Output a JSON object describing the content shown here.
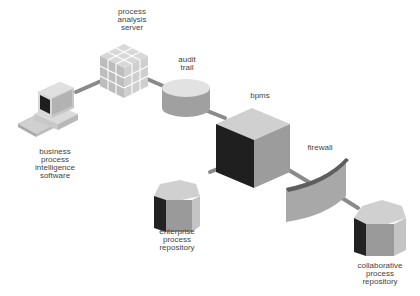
{
  "diagram": {
    "type": "architecture",
    "nodes": [
      {
        "id": "bpi",
        "label_lines": [
          "business",
          "process",
          "intelligence",
          "software"
        ],
        "shape": "computer-workstation"
      },
      {
        "id": "pas",
        "label_lines": [
          "process",
          "analysis",
          "server"
        ],
        "shape": "cube-grid"
      },
      {
        "id": "audit",
        "label_lines": [
          "audit",
          "trail"
        ],
        "shape": "cylinder"
      },
      {
        "id": "bpms",
        "label_lines": [
          "bpms"
        ],
        "shape": "cube"
      },
      {
        "id": "firewall",
        "label_lines": [
          "firewall"
        ],
        "shape": "curved-wall"
      },
      {
        "id": "epr",
        "label_lines": [
          "enterprise",
          "process",
          "repository"
        ],
        "shape": "hexagonal-prism"
      },
      {
        "id": "cpr",
        "label_lines": [
          "collaborative",
          "process",
          "repository"
        ],
        "shape": "hexagonal-prism"
      }
    ],
    "edges": [
      {
        "from": "bpi",
        "to": "pas"
      },
      {
        "from": "pas",
        "to": "audit"
      },
      {
        "from": "audit",
        "to": "bpms"
      },
      {
        "from": "bpms",
        "to": "epr"
      },
      {
        "from": "bpms",
        "to": "firewall"
      },
      {
        "from": "firewall",
        "to": "cpr"
      }
    ],
    "colors": {
      "connector": "#8a8a8a",
      "face_light": "#d6d6d6",
      "face_mid": "#9a9a9a",
      "face_dark": "#2a2a2a",
      "label_text": "#444444"
    }
  }
}
